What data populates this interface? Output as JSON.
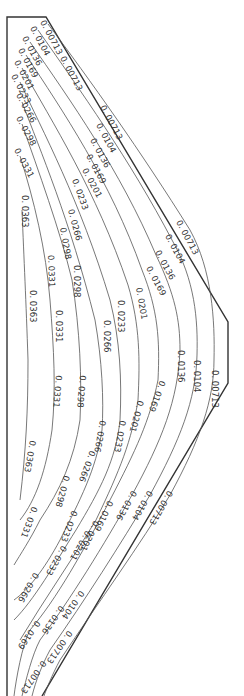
{
  "chart_data": {
    "type": "contour",
    "title": "",
    "xlabel": "",
    "ylabel": "",
    "orientation": "rotated 90° (labels read top-to-bottom)",
    "contour_levels": [
      "0.00713",
      "0.0104",
      "0.0136",
      "0.0169",
      "0.0201",
      "0.0233",
      "0.0266",
      "0.0298",
      "0.0331",
      "0.0363"
    ],
    "labels": [
      {
        "text": "0.00713",
        "x": 40,
        "y": 22,
        "rot": 62
      },
      {
        "text": "0.0104",
        "x": 30,
        "y": 28,
        "rot": 62
      },
      {
        "text": "0.0136",
        "x": 22,
        "y": 38,
        "rot": 62
      },
      {
        "text": "0.0169",
        "x": 18,
        "y": 50,
        "rot": 62
      },
      {
        "text": "0.0201",
        "x": 14,
        "y": 62,
        "rot": 62
      },
      {
        "text": "0.0233",
        "x": 11,
        "y": 76,
        "rot": 62
      },
      {
        "text": "0.0266",
        "x": 16,
        "y": 95,
        "rot": 62
      },
      {
        "text": "0.0298",
        "x": 16,
        "y": 118,
        "rot": 62
      },
      {
        "text": "0.0331",
        "x": 14,
        "y": 150,
        "rot": 62
      },
      {
        "text": "0.00713",
        "x": 60,
        "y": 58,
        "rot": 62
      },
      {
        "text": "0.00713",
        "x": 100,
        "y": 107,
        "rot": 62
      },
      {
        "text": "0.0104",
        "x": 96,
        "y": 125,
        "rot": 62
      },
      {
        "text": "0.0136",
        "x": 90,
        "y": 140,
        "rot": 62
      },
      {
        "text": "0.0169",
        "x": 86,
        "y": 156,
        "rot": 62
      },
      {
        "text": "0.0201",
        "x": 82,
        "y": 170,
        "rot": 62
      },
      {
        "text": "0.0233",
        "x": 72,
        "y": 180,
        "rot": 70
      },
      {
        "text": "0.0266",
        "x": 68,
        "y": 210,
        "rot": 75
      },
      {
        "text": "0.0298",
        "x": 60,
        "y": 228,
        "rot": 80
      },
      {
        "text": "0.0331",
        "x": 48,
        "y": 255,
        "rot": 88
      },
      {
        "text": "0.0363",
        "x": 22,
        "y": 195,
        "rot": 90
      },
      {
        "text": "0.00713",
        "x": 176,
        "y": 222,
        "rot": 62
      },
      {
        "text": "0.0104",
        "x": 165,
        "y": 236,
        "rot": 62
      },
      {
        "text": "0.0136",
        "x": 155,
        "y": 252,
        "rot": 62
      },
      {
        "text": "0.0169",
        "x": 146,
        "y": 268,
        "rot": 62
      },
      {
        "text": "0.0201",
        "x": 136,
        "y": 288,
        "rot": 80
      },
      {
        "text": "0.0233",
        "x": 118,
        "y": 300,
        "rot": 90
      },
      {
        "text": "0.0266",
        "x": 104,
        "y": 320,
        "rot": 90
      },
      {
        "text": "0.0298",
        "x": 74,
        "y": 265,
        "rot": 90
      },
      {
        "text": "0.0331",
        "x": 56,
        "y": 310,
        "rot": 90
      },
      {
        "text": "0.0363",
        "x": 30,
        "y": 290,
        "rot": 90
      },
      {
        "text": "0.00713",
        "x": 212,
        "y": 370,
        "rot": 90
      },
      {
        "text": "0.0104",
        "x": 194,
        "y": 360,
        "rot": 90
      },
      {
        "text": "0.0136",
        "x": 178,
        "y": 350,
        "rot": 90
      },
      {
        "text": "0.0169",
        "x": 160,
        "y": 380,
        "rot": 110
      },
      {
        "text": "0.0201",
        "x": 138,
        "y": 400,
        "rot": 105
      },
      {
        "text": "0.0233",
        "x": 120,
        "y": 420,
        "rot": 100
      },
      {
        "text": "0.0266",
        "x": 100,
        "y": 420,
        "rot": 100
      },
      {
        "text": "0.0298",
        "x": 80,
        "y": 375,
        "rot": 95
      },
      {
        "text": "0.0331",
        "x": 56,
        "y": 375,
        "rot": 95
      },
      {
        "text": "0.0363",
        "x": 30,
        "y": 440,
        "rot": 100
      },
      {
        "text": "0.00713",
        "x": 168,
        "y": 490,
        "rot": 120
      },
      {
        "text": "0.0104",
        "x": 148,
        "y": 490,
        "rot": 120
      },
      {
        "text": "0.0136",
        "x": 132,
        "y": 490,
        "rot": 120
      },
      {
        "text": "0.0169",
        "x": 108,
        "y": 500,
        "rot": 115
      },
      {
        "text": "0.0201",
        "x": 94,
        "y": 520,
        "rot": 115
      },
      {
        "text": "0.0233",
        "x": 72,
        "y": 510,
        "rot": 110
      },
      {
        "text": "0.0266",
        "x": 90,
        "y": 450,
        "rot": 110
      },
      {
        "text": "0.0298",
        "x": 64,
        "y": 475,
        "rot": 105
      },
      {
        "text": "0.0331",
        "x": 32,
        "y": 506,
        "rot": 110
      },
      {
        "text": "0.0266",
        "x": 34,
        "y": 572,
        "rot": 120
      },
      {
        "text": "0.0233",
        "x": 62,
        "y": 545,
        "rot": 120
      },
      {
        "text": "0.0201",
        "x": 86,
        "y": 530,
        "rot": 120
      },
      {
        "text": "0.0169",
        "x": 36,
        "y": 620,
        "rot": 125
      },
      {
        "text": "0.0136",
        "x": 60,
        "y": 605,
        "rot": 125
      },
      {
        "text": "0.0104",
        "x": 80,
        "y": 590,
        "rot": 125
      },
      {
        "text": "0.00713",
        "x": 68,
        "y": 630,
        "rot": 125
      },
      {
        "text": "0.00713",
        "x": 42,
        "y": 660,
        "rot": 125
      }
    ],
    "boundary": [
      [
        7,
        17
      ],
      [
        46,
        17
      ],
      [
        228,
        322
      ],
      [
        228,
        383
      ],
      [
        42,
        696
      ],
      [
        7,
        696
      ]
    ]
  }
}
